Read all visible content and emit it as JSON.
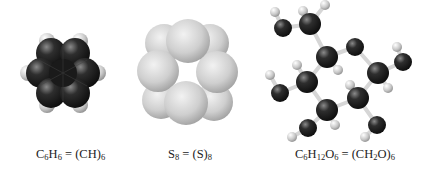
{
  "figure": {
    "molecules": [
      {
        "id": "benzene",
        "model": "space-filling",
        "label": {
          "parts": [
            {
              "t": "C"
            },
            {
              "sub": "6"
            },
            {
              "t": "H"
            },
            {
              "sub": "6"
            },
            {
              "t": " = (CH)"
            },
            {
              "sub": "6"
            }
          ],
          "text": "C6H6 = (CH)6"
        },
        "colors": {
          "carbon": "#1c1c1c",
          "hydrogen": "#d9d9d9"
        }
      },
      {
        "id": "cyclooctasulfur",
        "model": "space-filling",
        "label": {
          "parts": [
            {
              "t": "S"
            },
            {
              "sub": "8"
            },
            {
              "t": " = (S)"
            },
            {
              "sub": "8"
            }
          ],
          "text": "S8 = (S)8"
        },
        "colors": {
          "sulfur": "#cfcfcf"
        }
      },
      {
        "id": "glucose",
        "model": "ball-and-stick",
        "label": {
          "parts": [
            {
              "t": "C"
            },
            {
              "sub": "6"
            },
            {
              "t": "H"
            },
            {
              "sub": "12"
            },
            {
              "t": "O"
            },
            {
              "sub": "6"
            },
            {
              "t": " = (CH"
            },
            {
              "sub": "2"
            },
            {
              "t": "O)"
            },
            {
              "sub": "6"
            }
          ],
          "text": "C6H12O6 = (CH2O)6"
        },
        "colors": {
          "heavy_atom": "#222222",
          "hydrogen": "#cccccc",
          "bond": "#d8d8d8"
        }
      }
    ]
  }
}
